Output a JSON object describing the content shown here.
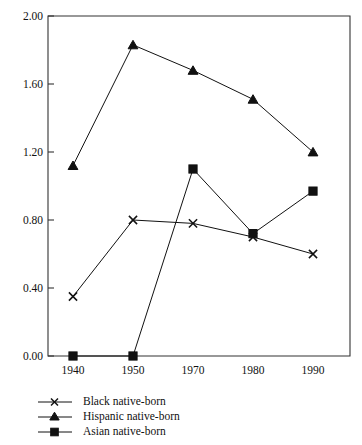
{
  "chart_data": {
    "type": "line",
    "title": "",
    "subtitle": "",
    "xlabel": "",
    "ylabel": "",
    "categories": [
      "1940",
      "1950",
      "1970",
      "1980",
      "1990"
    ],
    "x": [
      1940,
      1950,
      1970,
      1980,
      1990
    ],
    "series": [
      {
        "name": "Black native-born",
        "marker": "x",
        "values": [
          0.35,
          0.8,
          0.78,
          0.7,
          0.6
        ]
      },
      {
        "name": "Hispanic native-born",
        "marker": "triangle",
        "values": [
          1.12,
          1.83,
          1.68,
          1.51,
          1.2
        ]
      },
      {
        "name": "Asian native-born",
        "marker": "square",
        "values": [
          0.0,
          0.0,
          1.1,
          0.72,
          0.97
        ]
      }
    ],
    "ylim": [
      0.0,
      2.0
    ],
    "yticks": [
      "0.00",
      "0.40",
      "0.80",
      "1.20",
      "1.60",
      "2.00"
    ],
    "ytick_values": [
      0.0,
      0.4,
      0.8,
      1.2,
      1.6,
      2.0
    ],
    "xticks": [
      "1940",
      "1950",
      "1970",
      "1980",
      "1990"
    ],
    "grid": false,
    "legend_position": "bottom-left",
    "legend": [
      "Black native-born",
      "Hispanic native-born",
      "Asian native-born"
    ],
    "line_color": "#111111",
    "axis_color": "#333333",
    "background_color": "#ffffff"
  },
  "legend": {
    "items": [
      {
        "label": "Black native-born",
        "marker": "x-marker-icon"
      },
      {
        "label": "Hispanic native-born",
        "marker": "triangle-marker-icon"
      },
      {
        "label": "Asian native-born",
        "marker": "square-marker-icon"
      }
    ]
  },
  "axes": {
    "y_labels": [
      "2.00",
      "1.60",
      "1.20",
      "0.80",
      "0.40",
      "0.00"
    ],
    "x_labels": [
      "1940",
      "1950",
      "1970",
      "1980",
      "1990"
    ]
  }
}
